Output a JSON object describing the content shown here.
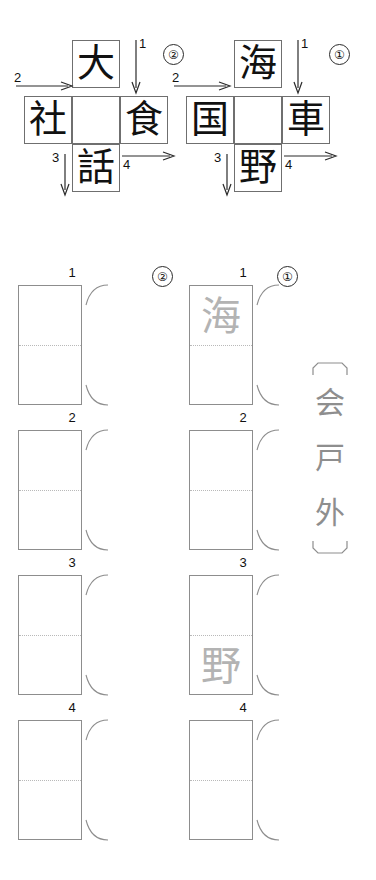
{
  "worksheet": {
    "type": "kanji-crossword-worksheet",
    "language": "ja"
  },
  "puzzles": [
    {
      "marker": "②",
      "marker_name": "circled-two",
      "cells": {
        "top": "大",
        "left": "社",
        "center": "",
        "right": "食",
        "bottom": "話"
      },
      "arrows": [
        {
          "number": "1",
          "direction": "down",
          "position": "top-right"
        },
        {
          "number": "2",
          "direction": "right",
          "position": "left"
        },
        {
          "number": "3",
          "direction": "down",
          "position": "bottom-left"
        },
        {
          "number": "4",
          "direction": "right",
          "position": "bottom-right"
        }
      ]
    },
    {
      "marker": "①",
      "marker_name": "circled-one",
      "cells": {
        "top": "海",
        "left": "国",
        "center": "",
        "right": "車",
        "bottom": "野"
      },
      "arrows": [
        {
          "number": "1",
          "direction": "down",
          "position": "top-right"
        },
        {
          "number": "2",
          "direction": "right",
          "position": "left"
        },
        {
          "number": "3",
          "direction": "down",
          "position": "bottom-left"
        },
        {
          "number": "4",
          "direction": "right",
          "position": "bottom-right"
        }
      ]
    }
  ],
  "answer_columns": [
    {
      "marker": "②",
      "marker_name": "circled-two",
      "boxes": [
        {
          "number": "1",
          "top": "",
          "bottom": ""
        },
        {
          "number": "2",
          "top": "",
          "bottom": ""
        },
        {
          "number": "3",
          "top": "",
          "bottom": ""
        },
        {
          "number": "4",
          "top": "",
          "bottom": ""
        }
      ]
    },
    {
      "marker": "①",
      "marker_name": "circled-one",
      "boxes": [
        {
          "number": "1",
          "top": "海",
          "bottom": ""
        },
        {
          "number": "2",
          "top": "",
          "bottom": ""
        },
        {
          "number": "3",
          "top": "",
          "bottom": "野"
        },
        {
          "number": "4",
          "top": "",
          "bottom": ""
        }
      ]
    }
  ],
  "word_bank": {
    "bracket_open": "〔",
    "bracket_close": "〕",
    "characters": [
      "会",
      "戸",
      "外"
    ]
  },
  "colors": {
    "ink": "#111111",
    "grid_line": "#6f6f6f",
    "box_line": "#8d8d8d",
    "dotted_line": "#b9b9b9",
    "hint_gray": "#b3b3b3",
    "bank_gray": "#8e8e8e",
    "background": "#ffffff"
  }
}
